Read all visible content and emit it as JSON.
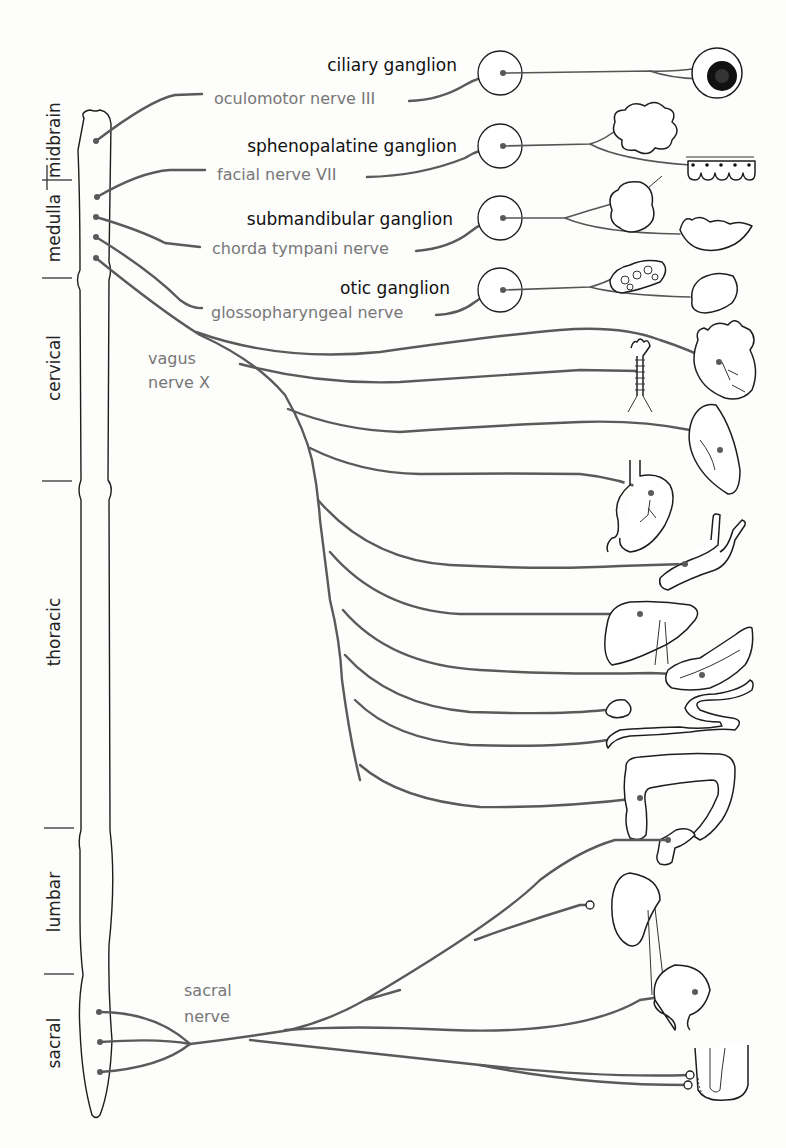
{
  "diagram": {
    "spinal_regions": [
      {
        "label": "midbrain"
      },
      {
        "label": "medulla"
      },
      {
        "label": "cervical"
      },
      {
        "label": "thoracic"
      },
      {
        "label": "lumbar"
      },
      {
        "label": "sacral"
      }
    ],
    "ganglia": [
      {
        "label": "ciliary ganglion"
      },
      {
        "label": "sphenopalatine ganglion"
      },
      {
        "label": "submandibular ganglion"
      },
      {
        "label": "otic ganglion"
      }
    ],
    "nerves": [
      {
        "label": "oculomotor nerve III"
      },
      {
        "label": "facial nerve VII"
      },
      {
        "label": "chorda tympani nerve"
      },
      {
        "label": "glossopharyngeal nerve"
      }
    ],
    "vagus": {
      "line1": "vagus",
      "line2": "nerve X"
    },
    "sacral_nerve": {
      "line1": "sacral",
      "line2": "nerve"
    },
    "organs": [
      "eye",
      "lacrimal gland",
      "nasal mucosa",
      "submandibular gland",
      "sublingual gland",
      "parotid gland",
      "tongue/mucosa",
      "heart",
      "trachea/bronchi",
      "lung",
      "stomach",
      "blood vessels",
      "liver",
      "pancreas",
      "gallbladder",
      "small intestine",
      "large intestine",
      "rectum",
      "kidney",
      "bladder",
      "genitals"
    ],
    "colors": {
      "nerve": "#5a5a5a",
      "outline": "#1d1d1d",
      "nerve_label": "#777777",
      "ganglion_label": "#111111"
    }
  }
}
